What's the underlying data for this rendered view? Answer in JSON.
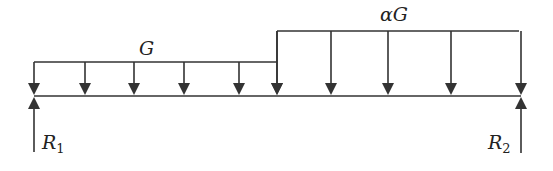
{
  "diagram": {
    "type": "beam-loading",
    "stroke_color": "#333333",
    "labels": {
      "left_load": "G",
      "right_load": "αG",
      "left_reaction_base": "R",
      "left_reaction_sub": "1",
      "right_reaction_base": "R",
      "right_reaction_sub": "2"
    },
    "beam": {
      "x1": 34,
      "x2": 521,
      "y": 96
    },
    "left_load": {
      "x1": 34,
      "x2": 277,
      "top": 62,
      "arrows_x": [
        34,
        85,
        134,
        184,
        239,
        277
      ]
    },
    "right_load": {
      "x1": 277,
      "x2": 519,
      "top": 31,
      "arrows_x": [
        277,
        331,
        388,
        451,
        521
      ]
    },
    "reactions": [
      {
        "name": "R1",
        "x": 34,
        "y_bottom": 152,
        "y_top": 97
      },
      {
        "name": "R2",
        "x": 521,
        "y_bottom": 153,
        "y_top": 97
      }
    ]
  }
}
